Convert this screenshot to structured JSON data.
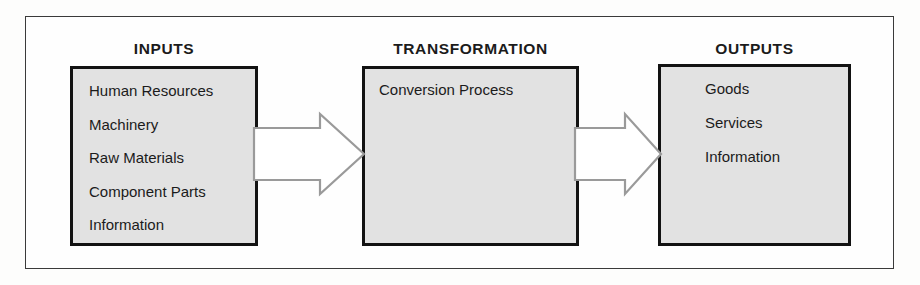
{
  "diagram": {
    "title_inputs": "INPUTS",
    "title_transformation": "TRANSFORMATION",
    "title_outputs": "OUTPUTS",
    "colors": {
      "box_fill": "#e2e2e2",
      "box_border": "#121212",
      "frame_border": "#3a3a3a",
      "arrow_stroke": "#9a9a9a",
      "arrow_fill": "#ffffff",
      "text": "#1b1b1b",
      "page_background": "#fdfdfc"
    },
    "columns": [
      {
        "heading": "INPUTS",
        "items": [
          "Human Resources",
          "Machinery",
          "Raw Materials",
          "Component Parts",
          "Information"
        ]
      },
      {
        "heading": "TRANSFORMATION",
        "items": [
          "Conversion Process"
        ]
      },
      {
        "heading": "OUTPUTS",
        "items": [
          "Goods",
          "Services",
          "Information"
        ]
      }
    ],
    "arrows": [
      {
        "name": "inputs-to-transformation",
        "direction": "right"
      },
      {
        "name": "transformation-to-outputs",
        "direction": "right"
      }
    ]
  }
}
